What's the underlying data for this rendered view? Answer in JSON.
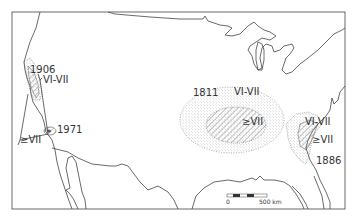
{
  "map": {
    "title": "Earthquake intensity zones",
    "colors": {
      "line": "#444444",
      "background": "#ffffff",
      "stipple": "#777777",
      "hatch": "#555555"
    },
    "events": [
      {
        "year": "1906",
        "zone_outer": "VI-VII",
        "zone_inner": "≥VII",
        "location": "California coast"
      },
      {
        "year": "1971",
        "zone_inner": "≥VII",
        "location": "Southern California"
      },
      {
        "year": "1811",
        "zone_outer": "VI-VII",
        "zone_inner": "≥VII",
        "location": "Central Mississippi Valley"
      },
      {
        "year": "1886",
        "zone_outer": "VI-VII",
        "zone_inner": "≥VII",
        "location": "Southeast Atlantic coast"
      }
    ],
    "labels": {
      "y1906": "1906",
      "y1906_zone": "VI-VII",
      "y1971": "1971",
      "west_inner": "≥VII",
      "y1811": "1811",
      "y1811_outer": "VI-VII",
      "y1811_inner": "≥VII",
      "y1886": "1886",
      "y1886_outer": "VI-VII",
      "y1886_inner": "≥VII"
    },
    "scale_bar": {
      "start_label": "0",
      "end_label": "500 km"
    }
  }
}
